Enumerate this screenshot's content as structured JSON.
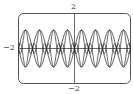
{
  "chart_data": {
    "type": "line",
    "title": "",
    "xlabel": "",
    "ylabel": "",
    "ylim": [
      -2,
      2
    ],
    "tick_labels": {
      "y_top": "2",
      "y_bottom": "-2",
      "x_left": "-2"
    },
    "grid": false,
    "legend": null,
    "series": [
      {
        "name": "envelope-upper",
        "description": "upper arcs of lens-shaped lobes, 8 lobes across window, peak ~1"
      },
      {
        "name": "envelope-lower",
        "description": "lower arcs mirrored, trough ~-1"
      },
      {
        "name": "oscillation",
        "description": "high-frequency oscillation bounded by envelope, crossing inside each lobe"
      }
    ],
    "lobes": 8
  },
  "labels": {
    "top": "2",
    "bottom": "−2",
    "left": "−2"
  }
}
